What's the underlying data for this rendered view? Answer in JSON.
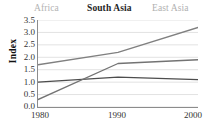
{
  "chart_data": {
    "type": "line",
    "title": "",
    "xlabel": "",
    "ylabel": "Index",
    "x": [
      1980,
      1990,
      2000
    ],
    "xtick_labels": [
      "1980",
      "1990",
      "2000"
    ],
    "ytick_labels": [
      "0.0",
      "0.5",
      "1.0",
      "1.5",
      "2.0",
      "2.5",
      "3.0",
      "3.5"
    ],
    "ytick_values": [
      0.0,
      0.5,
      1.0,
      1.5,
      2.0,
      2.5,
      3.0,
      3.5
    ],
    "ylim": [
      0.0,
      3.5
    ],
    "xlim": [
      1980,
      2000
    ],
    "grid": true,
    "grid_axis": "y",
    "legend_position": "top",
    "series": [
      {
        "name": "Africa",
        "values": [
          1.0,
          1.2,
          1.1
        ],
        "color": "#4d4d4d"
      },
      {
        "name": "South Asia",
        "values": [
          0.3,
          1.75,
          1.9
        ],
        "color": "#737373"
      },
      {
        "name": "East Asia",
        "values": [
          1.7,
          2.2,
          3.2
        ],
        "color": "#808080"
      }
    ]
  },
  "legend": {
    "africa": "Africa",
    "south_asia": "South Asia",
    "east_asia": "East Asia"
  },
  "axes": {
    "y_title": "Index",
    "y_labels": {
      "t0": "3.5",
      "t1": "3.0",
      "t2": "2.5",
      "t3": "2.0",
      "t4": "1.5",
      "t5": "1.0",
      "t6": "0.5",
      "t7": "0.0"
    },
    "x_labels": {
      "x0": "1980",
      "x1": "1990",
      "x2": "2000"
    }
  },
  "colors": {
    "axis": "#8c8c8c",
    "grid": "#e2e2e2",
    "text": "#333333",
    "legend_muted": "#b3b3b3",
    "legend_active": "#262626"
  }
}
